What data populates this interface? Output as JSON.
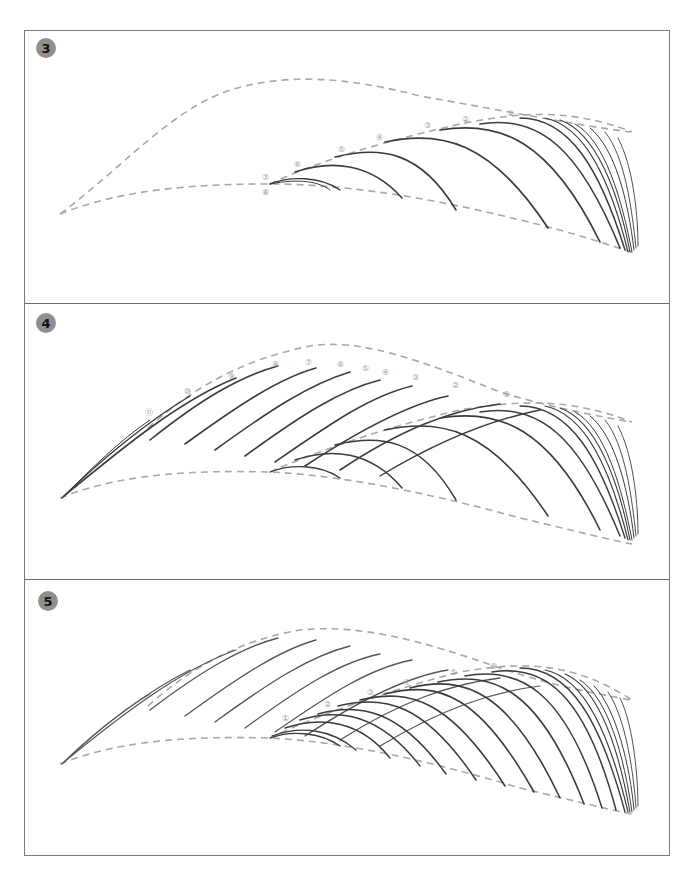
{
  "figure": {
    "type": "eyebrow hair-stroke drawing steps",
    "colors": {
      "border": "#7a7a7a",
      "badge_bg": "#8f8f8f",
      "guide_dashed": "#a8a8a8",
      "stroke": "#3c3c3c",
      "label": "#9a9a9a"
    }
  },
  "panels": [
    {
      "step": "3",
      "labels": [
        "①",
        "②",
        "③",
        "④",
        "⑤",
        "⑥",
        "⑦",
        "⑧"
      ]
    },
    {
      "step": "4",
      "labels": [
        "①",
        "②",
        "③",
        "④",
        "⑤",
        "⑥",
        "⑦",
        "⑧",
        "⑨",
        "⑩",
        "⑪"
      ]
    },
    {
      "step": "5",
      "labels": [
        "①",
        "②",
        "③",
        "④",
        "⑤",
        "⑥"
      ]
    }
  ]
}
